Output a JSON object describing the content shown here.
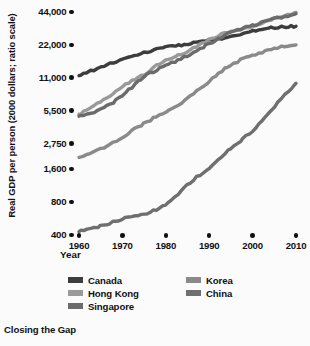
{
  "caption": "Closing the Gap",
  "axes": {
    "ylabel": "Real GDP per person (2000 dollars; ratio scale)",
    "xlabel": "Year"
  },
  "chart_data": {
    "type": "line",
    "title": "Closing the Gap",
    "xlabel": "Year",
    "ylabel": "Real GDP per person (2000 dollars; ratio scale)",
    "yscale": "log",
    "grid": false,
    "legend_position": "bottom",
    "xlim": [
      1960,
      2010
    ],
    "ylim": [
      400,
      44000
    ],
    "xticks": [
      1960,
      1970,
      1980,
      1990,
      2000,
      2010
    ],
    "xticklabels": [
      "1960",
      "1970",
      "1980",
      "1990",
      "2000",
      "2010"
    ],
    "yticks": [
      400,
      800,
      1600,
      2750,
      5500,
      11000,
      22000,
      44000
    ],
    "yticklabels": [
      "400",
      "800",
      "1,600",
      "2,750",
      "5,500",
      "11,000",
      "22,000",
      "44,000"
    ],
    "x": [
      1960,
      1965,
      1970,
      1975,
      1980,
      1985,
      1990,
      1995,
      2000,
      2005,
      2010
    ],
    "series": [
      {
        "name": "Canada",
        "color": "#3d3d3d",
        "values": [
          11500,
          13800,
          16200,
          18600,
          20800,
          22400,
          24600,
          25800,
          29500,
          31800,
          32600
        ]
      },
      {
        "name": "Hong Kong",
        "color": "#9a9a9a",
        "values": [
          5100,
          6600,
          9200,
          11800,
          16000,
          19000,
          24500,
          29500,
          32500,
          38500,
          43500
        ]
      },
      {
        "name": "Singapore",
        "color": "#6b6b6b",
        "values": [
          4900,
          5600,
          7600,
          11200,
          14200,
          17500,
          22500,
          28500,
          33000,
          38000,
          42500
        ]
      },
      {
        "name": "Korea",
        "color": "#8a8a8a",
        "values": [
          2050,
          2450,
          3150,
          4200,
          5400,
          7100,
          10200,
          14500,
          17500,
          20500,
          22000
        ]
      },
      {
        "name": "China",
        "color": "#6f6f6f",
        "values": [
          430,
          480,
          560,
          620,
          760,
          1150,
          1650,
          2500,
          3600,
          6000,
          9800
        ]
      }
    ]
  },
  "legend": [
    {
      "label": "Canada",
      "color": "#3d3d3d"
    },
    {
      "label": "Hong Kong",
      "color": "#9a9a9a"
    },
    {
      "label": "Singapore",
      "color": "#6b6b6b"
    },
    {
      "label": "Korea",
      "color": "#8a8a8a"
    },
    {
      "label": "China",
      "color": "#6f6f6f"
    }
  ]
}
